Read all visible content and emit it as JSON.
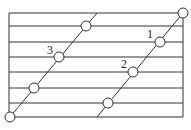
{
  "diagram": {
    "type": "parallel-lines-with-diagonal-paths",
    "frame": {
      "left": 9,
      "right": 183
    },
    "horizontal_lines_y": [
      13,
      26,
      42,
      57,
      72,
      88,
      103,
      117
    ],
    "diagonals": [
      {
        "name": "left-diagonal",
        "from": [
          10,
          117
        ],
        "to": [
          97,
          13
        ]
      },
      {
        "name": "right-diagonal",
        "from": [
          97,
          117
        ],
        "to": [
          183,
          13
        ]
      }
    ],
    "nodes": [
      {
        "name": "node-left-bottom",
        "x": 10,
        "y": 117
      },
      {
        "name": "node-left-2",
        "x": 34,
        "y": 88
      },
      {
        "name": "node-left-3",
        "x": 59,
        "y": 57
      },
      {
        "name": "node-left-top",
        "x": 86,
        "y": 26
      },
      {
        "name": "node-right-bottom",
        "x": 108,
        "y": 103
      },
      {
        "name": "node-right-2",
        "x": 133,
        "y": 72
      },
      {
        "name": "node-right-3",
        "x": 160,
        "y": 42
      },
      {
        "name": "node-right-top",
        "x": 183,
        "y": 13
      }
    ],
    "labels": [
      {
        "name": "label-1",
        "text": "1",
        "x": 147,
        "y": 38
      },
      {
        "name": "label-2",
        "text": "2",
        "x": 121,
        "y": 68
      },
      {
        "name": "label-3",
        "text": "3",
        "x": 47,
        "y": 54
      }
    ]
  }
}
